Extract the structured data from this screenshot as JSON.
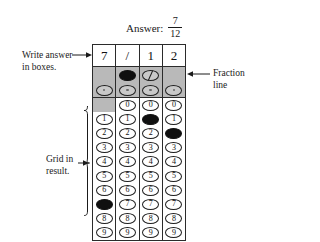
{
  "answer": {
    "label": "Answer:",
    "numerator": "7",
    "denominator": "12"
  },
  "annotations": {
    "write_answer": "Write answer\nin boxes.",
    "fraction_line": "Fraction\nline",
    "grid_in_result": "Grid in\nresult."
  },
  "grid": {
    "written_row": [
      "7",
      "/",
      "1",
      "2"
    ],
    "fraction_line_row": {
      "glyph": "/",
      "cells": [
        {
          "present": false,
          "filled": false
        },
        {
          "present": true,
          "filled": true
        },
        {
          "present": true,
          "filled": false
        },
        {
          "present": false,
          "filled": false
        }
      ]
    },
    "decimal_row": {
      "glyph": ".",
      "cells": [
        {
          "present": true,
          "filled": false
        },
        {
          "present": true,
          "filled": false
        },
        {
          "present": true,
          "filled": false
        },
        {
          "present": true,
          "filled": false
        }
      ]
    },
    "digits": [
      "0",
      "1",
      "2",
      "3",
      "4",
      "5",
      "6",
      "7",
      "8",
      "9"
    ],
    "columns": [
      {
        "index": 1,
        "has_zero": false,
        "filled_digit": "7"
      },
      {
        "index": 2,
        "has_zero": true,
        "filled_digit": null
      },
      {
        "index": 3,
        "has_zero": true,
        "filled_digit": "1"
      },
      {
        "index": 4,
        "has_zero": true,
        "filled_digit": "2"
      }
    ]
  },
  "colors": {
    "ink": "#1a1a1a",
    "shade": "#b9b9b9",
    "bubble_fill": "#101010",
    "paper": "#ffffff"
  }
}
